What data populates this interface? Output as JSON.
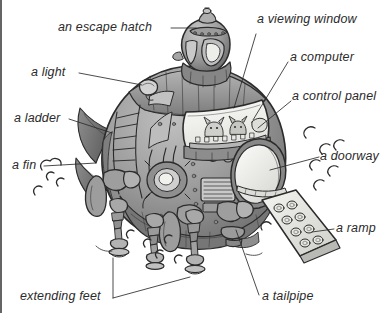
{
  "figure": {
    "kind": "labelled-illustration",
    "background_color": "#ffffff",
    "ink_color": "#2b2b2b",
    "hull_color": "#9a9a9a",
    "hull_shadow_color": "#6d6d6d",
    "hull_light_color": "#c4c4c4",
    "window_color": "#f2f2ef"
  },
  "labels": [
    {
      "id": "escape-hatch",
      "text": "an escape hatch",
      "x": 58,
      "y": 21,
      "align": "left"
    },
    {
      "id": "viewing-window",
      "text": "a viewing window",
      "x": 257,
      "y": 13,
      "align": "left"
    },
    {
      "id": "computer",
      "text": "a computer",
      "x": 290,
      "y": 51,
      "align": "left"
    },
    {
      "id": "light",
      "text": "a light",
      "x": 31,
      "y": 66,
      "align": "left"
    },
    {
      "id": "control-panel",
      "text": "a control panel",
      "x": 292,
      "y": 90,
      "align": "left"
    },
    {
      "id": "ladder",
      "text": "a ladder",
      "x": 14,
      "y": 112,
      "align": "left"
    },
    {
      "id": "doorway",
      "text": "a doorway",
      "x": 320,
      "y": 150,
      "align": "left"
    },
    {
      "id": "fin",
      "text": "a fin",
      "x": 12,
      "y": 159,
      "align": "left"
    },
    {
      "id": "ramp",
      "text": "a ramp",
      "x": 336,
      "y": 222,
      "align": "left"
    },
    {
      "id": "extending-feet",
      "text": "extending feet",
      "x": 20,
      "y": 290,
      "align": "left"
    },
    {
      "id": "tailpipe",
      "text": "a tailpipe",
      "x": 262,
      "y": 290,
      "align": "left"
    }
  ],
  "leader_lines": [
    {
      "id": "leader-escape-hatch",
      "for": "escape-hatch",
      "path": "M171,28 L196,28"
    },
    {
      "id": "leader-light",
      "for": "light",
      "path": "M79,73 L142,85"
    },
    {
      "id": "leader-ladder",
      "for": "ladder",
      "path": "M69,119 L112,133"
    },
    {
      "id": "leader-fin",
      "for": "fin",
      "path": "M44,166 L96,163"
    },
    {
      "id": "leader-viewing-window",
      "for": "viewing-window",
      "path": "M256,34 L234,108"
    },
    {
      "id": "leader-computer",
      "for": "computer",
      "path": "M288,62 L253,120"
    },
    {
      "id": "leader-control-panel",
      "for": "control-panel",
      "path": "M291,101 L258,128"
    },
    {
      "id": "leader-doorway",
      "for": "doorway",
      "path": "M319,157 L270,170"
    },
    {
      "id": "leader-ramp",
      "for": "ramp",
      "path": "M334,229 L312,232"
    },
    {
      "id": "leader-extending-feet",
      "for": "extending-feet",
      "path": "M113,298 L113,258 M113,298 L190,277"
    },
    {
      "id": "leader-tailpipe",
      "for": "tailpipe",
      "path": "M259,295 L236,230"
    }
  ],
  "parts": [
    {
      "id": "dome-turret",
      "name": "escape hatch dome"
    },
    {
      "id": "hull",
      "name": "main hull"
    },
    {
      "id": "viewing-window",
      "name": "viewing window"
    },
    {
      "id": "doorway",
      "name": "oval doorway"
    },
    {
      "id": "ramp",
      "name": "boarding ramp"
    },
    {
      "id": "fin",
      "name": "side fin"
    },
    {
      "id": "ladder",
      "name": "rung ladder"
    },
    {
      "id": "light",
      "name": "exterior light"
    },
    {
      "id": "leg-left",
      "name": "extending foot left"
    },
    {
      "id": "leg-mid",
      "name": "extending foot middle"
    },
    {
      "id": "leg-right",
      "name": "extending foot right"
    },
    {
      "id": "tailpipe",
      "name": "tailpipe nozzle"
    },
    {
      "id": "crew",
      "name": "crew at control panel"
    },
    {
      "id": "dust-puffs",
      "name": "dust puffs"
    }
  ]
}
